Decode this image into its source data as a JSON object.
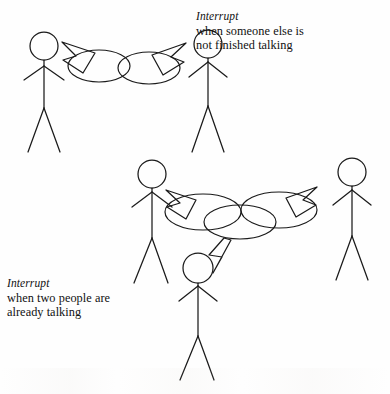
{
  "figure": {
    "background_color": "#fefefe",
    "ink_color": "#1a1a1a",
    "width": 390,
    "height": 394
  },
  "captions": {
    "top": {
      "lead": "Interrupt",
      "line1": "when someone else is",
      "line2": "not finished talking"
    },
    "bottom": {
      "lead": "Interrupt",
      "line1": "when two people are",
      "line2": "already talking"
    }
  },
  "scenes": [
    {
      "id": "scene-two-people",
      "name": "interrupt-when-someone-else-is-not-finished-talking",
      "people": [
        {
          "id": "person-top-left",
          "role": "speaker",
          "head_cx": 44,
          "head_cy": 46
        },
        {
          "id": "person-top-right",
          "role": "interrupter",
          "head_cx": 208,
          "head_cy": 44
        }
      ],
      "bubbles": [
        {
          "id": "bubble-top-left",
          "owner": "person-top-left",
          "cx": 99,
          "cy": 66
        },
        {
          "id": "bubble-top-right",
          "owner": "person-top-right",
          "cx": 149,
          "cy": 68
        }
      ],
      "tails": [
        {
          "id": "tail-top-left",
          "points_to": "person-top-left",
          "direction": "up-left"
        },
        {
          "id": "tail-top-right",
          "points_to": "person-top-right",
          "direction": "up-right"
        }
      ]
    },
    {
      "id": "scene-three-people",
      "name": "interrupt-when-two-people-are-already-talking",
      "people": [
        {
          "id": "person-mid-left",
          "role": "speaker",
          "head_cx": 152,
          "head_cy": 174
        },
        {
          "id": "person-mid-right",
          "role": "speaker",
          "head_cx": 352,
          "head_cy": 172
        },
        {
          "id": "person-bottom-center",
          "role": "interrupter",
          "head_cx": 198,
          "head_cy": 268
        }
      ],
      "bubbles": [
        {
          "id": "bubble-mid-left",
          "owner": "person-mid-left",
          "cx": 203,
          "cy": 212
        },
        {
          "id": "bubble-mid-right",
          "owner": "person-mid-right",
          "cx": 279,
          "cy": 210
        },
        {
          "id": "bubble-mid-center",
          "owner": "person-bottom-center",
          "cx": 240,
          "cy": 222
        }
      ],
      "tails": [
        {
          "id": "tail-mid-left",
          "points_to": "person-mid-left",
          "direction": "up-left"
        },
        {
          "id": "tail-mid-right",
          "points_to": "person-mid-right",
          "direction": "up-right"
        },
        {
          "id": "tail-mid-down",
          "points_to": "person-bottom-center",
          "direction": "down-left"
        }
      ]
    }
  ],
  "icons": {
    "stick-figure": "stick-figure-icon",
    "speech-bubble": "speech-bubble-icon",
    "speech-tail": "speech-tail-icon"
  }
}
